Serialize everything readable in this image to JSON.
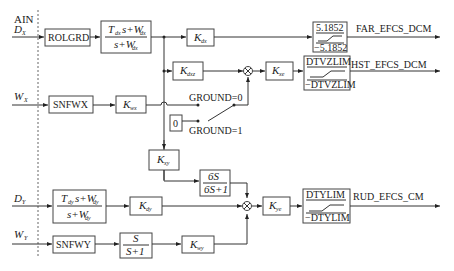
{
  "diagram": {
    "inputs": {
      "ain": "AIN",
      "dx": "D",
      "dx_sub": "X",
      "wx": "W",
      "wx_sub": "X",
      "dy": "D",
      "dy_sub": "Y",
      "wy": "W",
      "wy_sub": "Y"
    },
    "blocks": {
      "rolgrd": "ROLGRD",
      "filter_x_num": "T",
      "filter_x_num_sub": "dx",
      "filter_x_num_rest": "s+W",
      "filter_x_num_rest_sub": "dx",
      "filter_x_den": "s+W",
      "filter_x_den_sub": "dx",
      "kdx": "K",
      "kdx_sub": "dx",
      "kdxz": "K",
      "kdxz_sub": "dxz",
      "snfwx": "SNFWX",
      "kwx": "K",
      "kwx_sub": "wx",
      "zero": "0",
      "kxy": "K",
      "kxy_sub": "xy",
      "washout_num": "6S",
      "washout_den": "6S+1",
      "kxe": "K",
      "kxe_sub": "xe",
      "filter_y_num": "T",
      "filter_y_num_sub": "dy",
      "filter_y_num_rest": "s+W",
      "filter_y_num_rest_sub": "dy",
      "filter_y_den": "s+W",
      "filter_y_den_sub": "dy",
      "kdy": "K",
      "kdy_sub": "dy",
      "kye": "K",
      "kye_sub": "ye",
      "snfwy": "SNFWY",
      "hp_num": "S",
      "hp_den": "S+1",
      "kwy": "K",
      "kwy_sub": "wy"
    },
    "switch": {
      "ground0": "GROUND=0",
      "ground1": "GROUND=1"
    },
    "limiters": {
      "far_upper": "5.1852",
      "far_lower": "−5.1852",
      "hst_upper": "DTVZLIM",
      "hst_lower": "−DTVZLIM",
      "rud_upper": "DTYLIM",
      "rud_lower": "−DTYLIM"
    },
    "outputs": {
      "far": "FAR_EFCS_DCM",
      "hst": "HST_EFCS_DCM",
      "rud": "RUD_EFCS_CM"
    }
  }
}
